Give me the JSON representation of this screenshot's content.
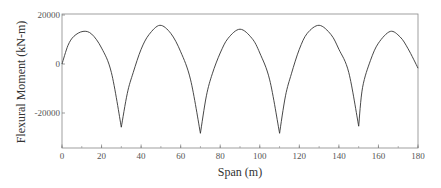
{
  "chart_data": {
    "type": "line",
    "title": "",
    "xlabel": "Span (m)",
    "ylabel": "Flexural Moment (kN-m)",
    "xlim": [
      0,
      180
    ],
    "ylim": [
      -35000,
      20000
    ],
    "xticks": [
      0,
      20,
      40,
      60,
      80,
      100,
      120,
      140,
      160,
      180
    ],
    "yticks": [
      20000,
      0,
      -20000
    ],
    "xtick_labels": [
      "0",
      "20",
      "40",
      "60",
      "80",
      "100",
      "120",
      "140",
      "160",
      "180"
    ],
    "ytick_labels": [
      "20000",
      "0",
      "-20000"
    ],
    "grid": false,
    "legend": null,
    "series": [
      {
        "name": "Flexural Moment",
        "color": "#333333",
        "x": [
          0,
          3,
          6,
          10.6,
          15,
          20,
          25,
          30,
          33,
          36,
          40,
          44,
          49.5,
          55,
          60,
          65,
          70,
          73,
          76,
          80,
          84,
          90,
          96,
          100,
          105,
          110,
          113,
          116,
          120,
          124,
          130,
          136,
          140,
          145,
          150,
          152,
          156,
          160,
          166,
          171,
          175,
          180
        ],
        "y": [
          0,
          7500,
          11300,
          13300,
          12200,
          6500,
          -3500,
          -25800,
          -12000,
          -3500,
          6000,
          12000,
          15800,
          12500,
          5000,
          -6500,
          -28300,
          -13000,
          -4000,
          4500,
          10500,
          14200,
          10500,
          4500,
          -6500,
          -28300,
          -13000,
          -4000,
          6000,
          12500,
          15800,
          12000,
          6000,
          -3500,
          -25400,
          -9500,
          1500,
          8500,
          13300,
          11000,
          6200,
          -1700
        ]
      }
    ],
    "annotations": []
  }
}
